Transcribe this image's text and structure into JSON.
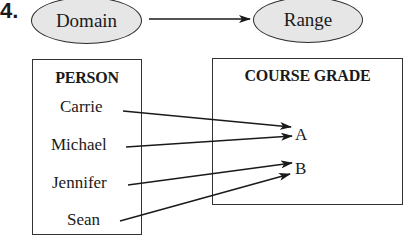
{
  "problem_number": "4.",
  "domain_label": "Domain",
  "range_label": "Range",
  "domain_set": {
    "title": "PERSON",
    "items": [
      "Carrie",
      "Michael",
      "Jennifer",
      "Sean"
    ]
  },
  "range_set": {
    "title": "COURSE GRADE",
    "items": [
      "A",
      "B"
    ]
  },
  "mappings": [
    {
      "from": "Carrie",
      "to": "A"
    },
    {
      "from": "Michael",
      "to": "A"
    },
    {
      "from": "Jennifer",
      "to": "B"
    },
    {
      "from": "Sean",
      "to": "B"
    }
  ],
  "colors": {
    "ellipse_fill": "#e6e6e6",
    "stroke": "#1a1a1a"
  }
}
